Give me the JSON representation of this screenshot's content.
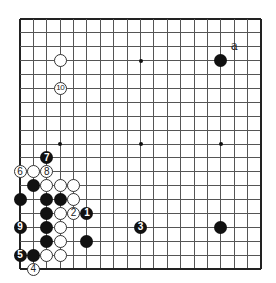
{
  "board": {
    "size": 19,
    "origin_px": [
      20,
      19
    ],
    "spacing_px": [
      13.39,
      13.89
    ],
    "line_color": "#555555",
    "star_points": [
      [
        4,
        4
      ],
      [
        10,
        4
      ],
      [
        16,
        4
      ],
      [
        4,
        10
      ],
      [
        10,
        10
      ],
      [
        16,
        10
      ],
      [
        4,
        16
      ],
      [
        10,
        16
      ],
      [
        16,
        16
      ]
    ]
  },
  "stones": [
    {
      "color": "white",
      "col": 4,
      "row": 4,
      "label": ""
    },
    {
      "color": "black",
      "col": 16,
      "row": 4,
      "label": ""
    },
    {
      "color": "white",
      "col": 4,
      "row": 6,
      "label": "10"
    },
    {
      "color": "black",
      "col": 3,
      "row": 11,
      "label": "7"
    },
    {
      "color": "white",
      "col": 1,
      "row": 12,
      "label": "6"
    },
    {
      "color": "white",
      "col": 2,
      "row": 12,
      "label": ""
    },
    {
      "color": "white",
      "col": 3,
      "row": 12,
      "label": "8"
    },
    {
      "color": "black",
      "col": 2,
      "row": 13,
      "label": ""
    },
    {
      "color": "white",
      "col": 3,
      "row": 13,
      "label": ""
    },
    {
      "color": "white",
      "col": 4,
      "row": 13,
      "label": ""
    },
    {
      "color": "white",
      "col": 5,
      "row": 13,
      "label": ""
    },
    {
      "color": "black",
      "col": 1,
      "row": 14,
      "label": ""
    },
    {
      "color": "black",
      "col": 3,
      "row": 14,
      "label": ""
    },
    {
      "color": "black",
      "col": 4,
      "row": 14,
      "label": ""
    },
    {
      "color": "white",
      "col": 5,
      "row": 14,
      "label": ""
    },
    {
      "color": "black",
      "col": 3,
      "row": 15,
      "label": ""
    },
    {
      "color": "white",
      "col": 4,
      "row": 15,
      "label": ""
    },
    {
      "color": "white",
      "col": 5,
      "row": 15,
      "label": "2"
    },
    {
      "color": "black",
      "col": 6,
      "row": 15,
      "label": "1"
    },
    {
      "color": "black",
      "col": 1,
      "row": 16,
      "label": "9"
    },
    {
      "color": "black",
      "col": 3,
      "row": 16,
      "label": ""
    },
    {
      "color": "white",
      "col": 4,
      "row": 16,
      "label": ""
    },
    {
      "color": "black",
      "col": 10,
      "row": 16,
      "label": "3"
    },
    {
      "color": "black",
      "col": 16,
      "row": 16,
      "label": ""
    },
    {
      "color": "black",
      "col": 3,
      "row": 17,
      "label": ""
    },
    {
      "color": "white",
      "col": 4,
      "row": 17,
      "label": ""
    },
    {
      "color": "black",
      "col": 6,
      "row": 17,
      "label": ""
    },
    {
      "color": "black",
      "col": 1,
      "row": 18,
      "label": "5"
    },
    {
      "color": "black",
      "col": 2,
      "row": 18,
      "label": ""
    },
    {
      "color": "white",
      "col": 3,
      "row": 18,
      "label": ""
    },
    {
      "color": "white",
      "col": 4,
      "row": 18,
      "label": ""
    },
    {
      "color": "white",
      "col": 2,
      "row": 19,
      "label": "4"
    }
  ],
  "markers": [
    {
      "text": "a",
      "col": 17,
      "row": 3
    }
  ]
}
